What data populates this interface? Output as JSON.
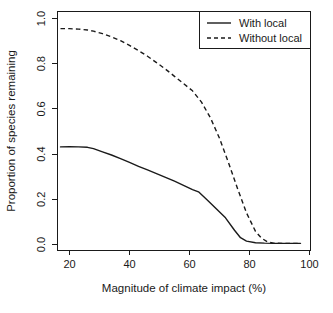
{
  "chart_data": {
    "type": "line",
    "title": "",
    "subtitle": "",
    "xlabel": "Magnitude of climate impact (%)",
    "ylabel": "Proportion of species remaining",
    "xlim": [
      16,
      98
    ],
    "ylim": [
      0.0,
      1.0
    ],
    "xticks": [
      20,
      40,
      60,
      80,
      100
    ],
    "xtick_labels": [
      "20",
      "40",
      "60",
      "80",
      "100"
    ],
    "yticks": [
      0.0,
      0.2,
      0.4,
      0.6,
      0.8,
      1.0
    ],
    "ytick_labels": [
      "0.0",
      "0.2",
      "0.4",
      "0.6",
      "0.8",
      "1.0"
    ],
    "grid": false,
    "legend_position": "top-right",
    "legend_entries": [
      "With local",
      "Without local"
    ],
    "series": [
      {
        "name": "With local",
        "style": "solid",
        "color": "#1a1a1a",
        "x": [
          17,
          20,
          23,
          26,
          28,
          31,
          34,
          37,
          40,
          43,
          46,
          49,
          52,
          55,
          58,
          61,
          63,
          66,
          69,
          72,
          75,
          77,
          79,
          82,
          85,
          88,
          91,
          94,
          97
        ],
        "y": [
          0.432,
          0.433,
          0.432,
          0.43,
          0.424,
          0.41,
          0.396,
          0.38,
          0.363,
          0.346,
          0.33,
          0.314,
          0.297,
          0.28,
          0.262,
          0.243,
          0.233,
          0.196,
          0.157,
          0.118,
          0.063,
          0.03,
          0.015,
          0.008,
          0.006,
          0.005,
          0.005,
          0.005,
          0.005
        ]
      },
      {
        "name": "Without local",
        "style": "dashed",
        "color": "#1a1a1a",
        "x": [
          17,
          20,
          23,
          26,
          28,
          31,
          34,
          37,
          40,
          43,
          46,
          49,
          52,
          55,
          58,
          61,
          64,
          67,
          70,
          73,
          76,
          79,
          82,
          84,
          86,
          88,
          91,
          94,
          97
        ],
        "y": [
          0.955,
          0.955,
          0.953,
          0.949,
          0.944,
          0.933,
          0.919,
          0.902,
          0.881,
          0.858,
          0.833,
          0.805,
          0.776,
          0.744,
          0.712,
          0.68,
          0.63,
          0.56,
          0.47,
          0.362,
          0.248,
          0.14,
          0.058,
          0.028,
          0.012,
          0.006,
          0.005,
          0.005,
          0.005
        ]
      }
    ]
  },
  "axes": {
    "x_title": "Magnitude of climate impact (%)",
    "y_title": "Proportion of species remaining"
  },
  "legend": {
    "items": [
      {
        "label": "With local",
        "style": "solid"
      },
      {
        "label": "Without local",
        "style": "dashed"
      }
    ]
  },
  "ticks": {
    "x": [
      "20",
      "40",
      "60",
      "80",
      "100"
    ],
    "y": [
      "0.0",
      "0.2",
      "0.4",
      "0.6",
      "0.8",
      "1.0"
    ]
  },
  "colors": {
    "ink": "#1a1a1a",
    "background": "#ffffff"
  }
}
